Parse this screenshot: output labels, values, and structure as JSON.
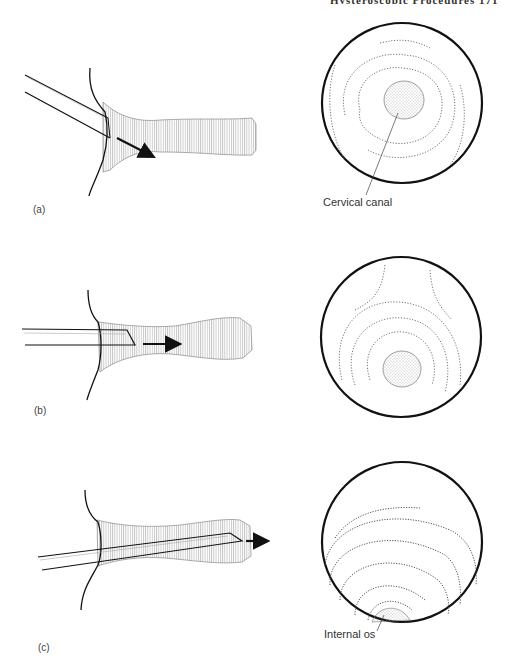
{
  "page": {
    "header_text": "Hysteroscopic Procedures 171"
  },
  "figure": {
    "panels": [
      {
        "id": "a",
        "label": "(a)",
        "callout": "Cervical canal",
        "arrow_direction": "down-right"
      },
      {
        "id": "b",
        "label": "(b)",
        "callout": "",
        "arrow_direction": "right"
      },
      {
        "id": "c",
        "label": "(c)",
        "callout": "Internal os",
        "arrow_direction": "right"
      }
    ]
  },
  "colors": {
    "line": "#111111",
    "hatch": "#888888",
    "background": "#ffffff"
  }
}
